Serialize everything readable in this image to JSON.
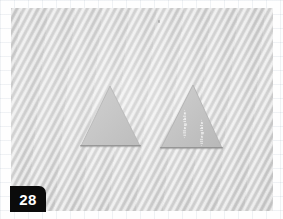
{
  "plate": {
    "number": "28",
    "caption_visible": false
  },
  "figure": {
    "type": "grayscale-photograph",
    "background_color": "#d9d9d9",
    "background_texture": "wavy-diagonal-halftone-moire",
    "margin_color": "#fefefe",
    "margin_grid": "faint-graph-paper"
  },
  "specimens": [
    {
      "id": "left-specimen",
      "shape": "triangle",
      "fill_color": "#cacaca",
      "edge_color": "#b4b4b4",
      "apex": {
        "x": 99,
        "y": 78
      },
      "base_left": {
        "x": 70,
        "y": 138
      },
      "base_right": {
        "x": 129,
        "y": 138
      },
      "markings": []
    },
    {
      "id": "right-specimen",
      "shape": "triangle",
      "fill_color": "#c6c6c6",
      "edge_color": "#b0b0b0",
      "apex": {
        "x": 182,
        "y": 77
      },
      "base_left": {
        "x": 150,
        "y": 141
      },
      "base_right": {
        "x": 211,
        "y": 141
      },
      "markings": [
        {
          "id": "legend-primary",
          "text": "·illegible·",
          "color": "#ffffff",
          "orientation": "rotated-90"
        },
        {
          "id": "legend-secondary",
          "text": "·illegible·",
          "color": "#ffffff",
          "orientation": "rotated-90"
        }
      ]
    }
  ],
  "artifacts": [
    {
      "id": "speck",
      "x": 158,
      "y": 20,
      "description": "small dark speck on print"
    }
  ]
}
